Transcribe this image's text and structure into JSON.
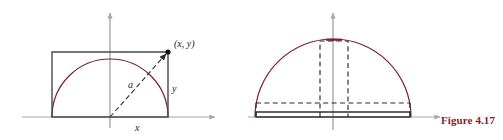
{
  "figure": {
    "caption": "Figure 4.17",
    "caption_color": "#8c1d2a",
    "arc_color": "#7d2027",
    "axis_color": "#a8a8a8",
    "solid_shape_color": "#3a3a3a",
    "dashed_shape_color": "#2b2b2b",
    "background": "#ffffff"
  },
  "left_panel": {
    "name": "semicircle-with-inscribed-rectangle",
    "labels": {
      "point": "(x, y)",
      "radius": "a",
      "horizontal": "x",
      "vertical": "y"
    },
    "geometry": {
      "center_x": 110,
      "center_y": 117,
      "radius": 58,
      "rect_left": 52,
      "rect_right": 168,
      "rect_top": 52,
      "rect_bottom": 117
    }
  },
  "right_panel": {
    "name": "semicircle-with-degenerate-rectangles",
    "labels": {},
    "geometry": {
      "center_x": 333,
      "center_y": 117,
      "radius": 78,
      "tall_rect_left": 320,
      "tall_rect_right": 348,
      "tall_rect_top": 41,
      "wide_rect_top": 103,
      "wide_rect_left": 256,
      "wide_rect_right": 410,
      "base_rect_top": 112
    }
  }
}
